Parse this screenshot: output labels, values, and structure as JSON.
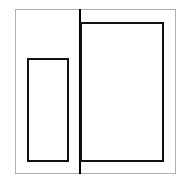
{
  "diagram": {
    "canvas": {
      "width": 188,
      "height": 187,
      "background": "#ffffff"
    },
    "shapes": [
      {
        "id": "outer-frame",
        "type": "rect",
        "x": 15,
        "y": 9,
        "w": 161,
        "h": 165,
        "stroke": "#b0b0b0",
        "stroke_width": 1
      },
      {
        "id": "divider-line",
        "type": "line",
        "x": 79,
        "y": 9,
        "w": 2,
        "h": 165,
        "stroke": "#000000"
      },
      {
        "id": "small-rect",
        "type": "rect",
        "x": 27,
        "y": 58,
        "w": 42,
        "h": 104,
        "stroke": "#111111",
        "stroke_width": 2.5
      },
      {
        "id": "large-rect",
        "type": "rect",
        "x": 80,
        "y": 22,
        "w": 84,
        "h": 140,
        "stroke": "#111111",
        "stroke_width": 2.5
      }
    ]
  }
}
